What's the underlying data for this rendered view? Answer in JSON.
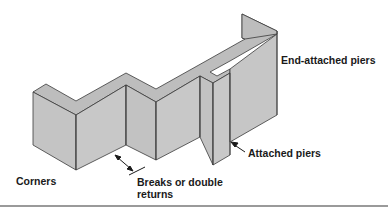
{
  "figure": {
    "colors": {
      "wall_fill": "#c8c8c8",
      "wall_top": "#bdbdbd",
      "wall_side": "#b3b3b3",
      "outline": "#3a3a3a",
      "text": "#1a1a1a",
      "rule": "#9a9a9a"
    }
  },
  "labels": {
    "end_attached_piers": "End-attached piers",
    "attached_piers": "Attached piers",
    "corners": "Corners",
    "breaks_line1": "Breaks or double",
    "breaks_line2": "returns"
  },
  "annotations": [
    {
      "name": "attached-piers-arrow",
      "type": "single-arrow"
    },
    {
      "name": "breaks-dimension-arrow",
      "type": "double-arrow"
    }
  ]
}
